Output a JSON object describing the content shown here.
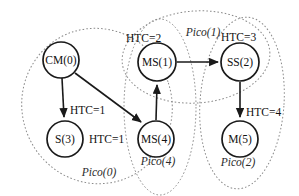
{
  "diagram": {
    "colors": {
      "node_stroke": "#1a1a1a",
      "node_fill": "#ffffff",
      "edge": "#1a1a1a",
      "cluster_stroke": "#8a8a8a",
      "background": "#ffffff",
      "text": "#111111"
    },
    "nodes": [
      {
        "id": "cm0",
        "label": "CM(0)",
        "cx": 61,
        "cy": 60,
        "r": 18
      },
      {
        "id": "s3",
        "label": "S(3)",
        "cx": 65,
        "cy": 139,
        "r": 18
      },
      {
        "id": "ms1",
        "label": "MS(1)",
        "cx": 157,
        "cy": 62,
        "r": 19
      },
      {
        "id": "ms4",
        "label": "MS(4)",
        "cx": 156,
        "cy": 139,
        "r": 18
      },
      {
        "id": "ss2",
        "label": "SS(2)",
        "cx": 240,
        "cy": 62,
        "r": 19
      },
      {
        "id": "m5",
        "label": "M(5)",
        "cx": 240,
        "cy": 139,
        "r": 18
      }
    ],
    "edges": [
      {
        "id": "cm0-s3",
        "from": "CM(0)",
        "to": "S(3)",
        "x1": 62,
        "y1": 78,
        "x2": 64,
        "y2": 119
      },
      {
        "id": "cm0-ms4",
        "from": "CM(0)",
        "to": "MS(4)",
        "x1": 75,
        "y1": 73,
        "x2": 143,
        "y2": 124
      },
      {
        "id": "ms4-ms1",
        "from": "MS(4)",
        "to": "MS(1)",
        "x1": 156,
        "y1": 120,
        "x2": 157,
        "y2": 83
      },
      {
        "id": "ms1-ss2",
        "from": "MS(1)",
        "to": "SS(2)",
        "x1": 177,
        "y1": 62,
        "x2": 219,
        "y2": 62
      },
      {
        "id": "ss2-m5",
        "from": "SS(2)",
        "to": "M(5)",
        "x1": 240,
        "y1": 82,
        "x2": 240,
        "y2": 119
      }
    ],
    "edge_labels": [
      {
        "id": "htc1-s3",
        "text": "HTC=1",
        "x": 70,
        "y": 111
      },
      {
        "id": "htc1-ms4",
        "text": "HTC=1",
        "x": 89,
        "y": 140
      },
      {
        "id": "htc2-ms1",
        "text": "HTC=2",
        "x": 126,
        "y": 39
      },
      {
        "id": "htc3-ss2",
        "text": "HTC=3",
        "x": 221,
        "y": 38
      },
      {
        "id": "htc4-m5",
        "text": "HTC=4",
        "x": 246,
        "y": 113
      }
    ],
    "clusters": [
      {
        "id": "pico0",
        "label": "Pico(0)",
        "cx": 97,
        "cy": 106,
        "rx": 75,
        "ry": 78,
        "rotate": -18,
        "label_x": 99,
        "label_y": 173
      },
      {
        "id": "pico4",
        "label": "Pico(4)",
        "cx": 160,
        "cy": 107,
        "rx": 36,
        "ry": 88,
        "rotate": 0,
        "label_x": 158,
        "label_y": 162
      },
      {
        "id": "pico1",
        "label": "Pico(1)",
        "cx": 196,
        "cy": 57,
        "rx": 74,
        "ry": 46,
        "rotate": -4,
        "label_x": 203,
        "label_y": 33
      },
      {
        "id": "pico2",
        "label": "Pico(2)",
        "cx": 242,
        "cy": 103,
        "rx": 42,
        "ry": 86,
        "rotate": 4,
        "label_x": 238,
        "label_y": 163
      }
    ]
  }
}
